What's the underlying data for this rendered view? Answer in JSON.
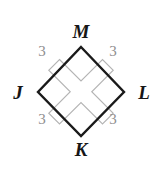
{
  "figure": {
    "type": "geometry-diagram",
    "background_color": "#ffffff",
    "outline_color": "#1a1a1a",
    "inner_shape_color": "#b4b4b4",
    "vertices": [
      {
        "id": "M",
        "label": "M",
        "position": "top",
        "x": 81,
        "y": 47
      },
      {
        "id": "L",
        "label": "L",
        "position": "right",
        "x": 124,
        "y": 92
      },
      {
        "id": "K",
        "label": "K",
        "position": "bottom",
        "x": 81,
        "y": 136
      },
      {
        "id": "J",
        "label": "J",
        "position": "left",
        "x": 38,
        "y": 92
      }
    ],
    "side_labels": [
      {
        "id": "JM",
        "label": "3",
        "position": "top-left",
        "color": "#8e8e8e"
      },
      {
        "id": "ML",
        "label": "3",
        "position": "top-right",
        "color": "#8e8e8e"
      },
      {
        "id": "JK",
        "label": "3",
        "position": "bottom-left",
        "color": "#8e8e8e"
      },
      {
        "id": "KL",
        "label": "3",
        "position": "bottom-right",
        "color": "#8e8e8e"
      }
    ],
    "inner_cross": {
      "name": "inscribed-cross",
      "stroke": "#b4b4b4",
      "stroke_width": 1.1,
      "fill": "none"
    }
  }
}
